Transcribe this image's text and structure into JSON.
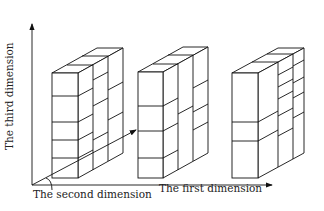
{
  "diagram": {
    "axes": {
      "first": "The first dimension",
      "second": "The second dimension",
      "third": "The third dimension"
    },
    "blocks": [
      {
        "name": "block-1",
        "front_dividers": 4,
        "slabs": 3
      },
      {
        "name": "block-2",
        "front_dividers": 3,
        "slabs": 3
      },
      {
        "name": "block-3",
        "front_dividers": 2,
        "slabs": 3
      }
    ],
    "colors": {
      "line": "#111111",
      "background": "#ffffff"
    }
  }
}
